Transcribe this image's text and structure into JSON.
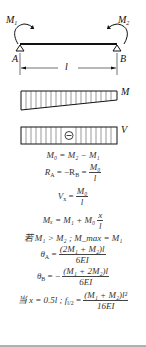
{
  "diagram": {
    "type": "simply-supported beam with end moments",
    "labels": {
      "moment_left": "M",
      "moment_left_sub": "1",
      "moment_right": "M",
      "moment_right_sub": "2",
      "support_left": "A",
      "support_right": "B",
      "span": "l",
      "moment_diagram": "M",
      "shear_diagram": "V",
      "shear_sign": "⊖"
    },
    "formulas": {
      "f1": "M₀ = M₂ − M₁",
      "f2_lhs": "R",
      "f2_sub_a": "A",
      "f2_mid": "= −R",
      "f2_sub_b": "B",
      "f2_eq": "=",
      "f2_num": "M₀",
      "f2_den": "l",
      "f3_lhs": "V",
      "f3_sub": "x",
      "f3_eq": "=",
      "f3_num": "M₀",
      "f3_den": "l",
      "f4_lhs": "Mₓ = M₁ + M₀",
      "f4_num": "x",
      "f4_den": "l",
      "f5": "若 M₁ > M₂ ; M_max = M₁",
      "f6_lhs": "θ",
      "f6_sub": "A",
      "f6_eq": "=",
      "f6_num": "(2M₁ + M₂)l",
      "f6_den": "6EI",
      "f7_lhs": "θ",
      "f7_sub": "B",
      "f7_eq": "= −",
      "f7_num": "(M₁ + 2M₂)l",
      "f7_den": "6EI",
      "f8_lhs": "当 x = 0.5l ; f",
      "f8_sub": "l/2",
      "f8_eq": "=",
      "f8_num": "(M₁ + M₂)l²",
      "f8_den": "16EI"
    },
    "colors": {
      "line": "#111111",
      "hatch": "#333333",
      "text": "#333333",
      "rule": "#b0b0b0"
    }
  }
}
